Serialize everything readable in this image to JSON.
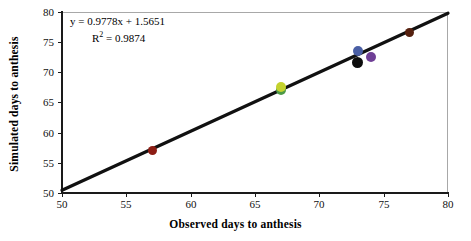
{
  "chart_data": {
    "type": "scatter",
    "title": "",
    "xlabel": "Observed days to anthesis",
    "ylabel": "Simulated days to anthesis",
    "xlim": [
      50,
      80
    ],
    "ylim": [
      50,
      80
    ],
    "xticks": [
      50,
      55,
      60,
      65,
      70,
      75,
      80
    ],
    "yticks": [
      50,
      55,
      60,
      65,
      70,
      75,
      80
    ],
    "grid": false,
    "legend": "none",
    "annotations": {
      "equation": "y = 0.9778x + 1.5651",
      "r_squared_label": "R",
      "r_squared_exp": "2",
      "r_squared_value": "= 0.9874",
      "r_squared_full": "R² = 0.9874"
    },
    "trendline": {
      "type": "linear",
      "slope": 0.9778,
      "intercept": 1.5651,
      "r2": 0.9874,
      "color": "#111111",
      "x_start": 50,
      "y_start": 50.45,
      "x_end": 80,
      "y_end": 79.79
    },
    "points": [
      {
        "name": "point-1",
        "x": 57.0,
        "y": 57.0,
        "color": "#8d1d14"
      },
      {
        "name": "point-2",
        "x": 67.0,
        "y": 67.6,
        "color": "#c4d22e"
      },
      {
        "name": "point-3",
        "x": 67.0,
        "y": 67.0,
        "color": "#4d9a46"
      },
      {
        "name": "point-4",
        "x": 73.0,
        "y": 73.5,
        "color": "#4a5fa5"
      },
      {
        "name": "point-5",
        "x": 73.0,
        "y": 71.7,
        "color": "#0d0d0d"
      },
      {
        "name": "point-6",
        "x": 74.0,
        "y": 72.6,
        "color": "#6f3f96"
      },
      {
        "name": "point-7",
        "x": 77.0,
        "y": 76.6,
        "color": "#55200f"
      }
    ],
    "colors": {
      "axis": "#1a1a1a",
      "frame": "#a8a8a8",
      "background": "#ffffff",
      "text": "#000000"
    }
  }
}
